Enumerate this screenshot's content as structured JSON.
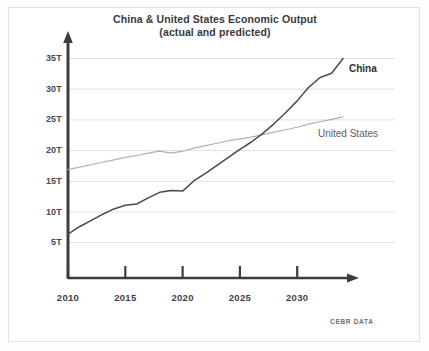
{
  "chart_data": {
    "type": "line",
    "title": "China & United States Economic Output",
    "subtitle": "(actual and predicted)",
    "xlabel": "",
    "ylabel": "",
    "xlim": [
      2010,
      2034
    ],
    "ylim": [
      0,
      36.5
    ],
    "xticks": [
      2010,
      2015,
      2020,
      2025,
      2030
    ],
    "xtick_labels": [
      "2010",
      "2015",
      "2020",
      "2025",
      "2030"
    ],
    "yticks": [
      5,
      10,
      15,
      20,
      25,
      30,
      35
    ],
    "ytick_labels": [
      "5T",
      "10T",
      "15T",
      "20T",
      "25T",
      "30T",
      "35T"
    ],
    "grid": "horizontal",
    "legend_position": "inline-right",
    "source": "CEBR DATA",
    "x": [
      2010,
      2011,
      2012,
      2013,
      2014,
      2015,
      2016,
      2017,
      2018,
      2019,
      2020,
      2021,
      2022,
      2023,
      2024,
      2025,
      2026,
      2027,
      2028,
      2029,
      2030,
      2031,
      2032,
      2033,
      2034
    ],
    "series": [
      {
        "name": "China",
        "color": "#4a4a4a",
        "values": [
          6.4,
          7.6,
          8.6,
          9.6,
          10.5,
          11.1,
          11.3,
          12.3,
          13.2,
          13.5,
          13.4,
          15.1,
          16.3,
          17.6,
          18.9,
          20.2,
          21.4,
          22.8,
          24.4,
          26.2,
          28.1,
          30.3,
          31.9,
          32.6,
          35.0
        ]
      },
      {
        "name": "United States",
        "color": "#b0b0b0",
        "values": [
          16.9,
          17.3,
          17.7,
          18.1,
          18.5,
          18.9,
          19.2,
          19.6,
          19.9,
          19.6,
          19.9,
          20.4,
          20.8,
          21.2,
          21.6,
          21.9,
          22.2,
          22.6,
          23.0,
          23.4,
          23.8,
          24.3,
          24.7,
          25.1,
          25.5
        ]
      }
    ],
    "annotations": [
      {
        "text": "China",
        "x": 2034,
        "y": 31.5
      },
      {
        "text": "United States",
        "x": 2032,
        "y": 21.0
      }
    ]
  },
  "axis": {
    "y_arrow": "up-arrow",
    "x_arrow": "right-arrow"
  }
}
